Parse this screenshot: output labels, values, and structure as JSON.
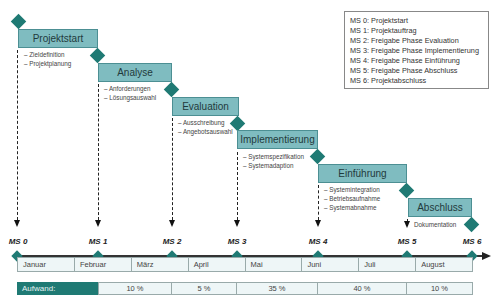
{
  "legend": {
    "items": [
      "MS 0: Projektstart",
      "MS 1: Projektauftrag",
      "MS 2: Freigabe Phase Evaluation",
      "MS 3: Freigabe Phase Implementierung",
      "MS 4: Freigabe Phase Einführung",
      "MS 5: Freigabe Phase Abschluss",
      "MS 6: Projektabschluss"
    ]
  },
  "phases": [
    {
      "name": "Projektstart",
      "tasks": [
        "– Zieldefinition",
        "– Projektplanung"
      ]
    },
    {
      "name": "Analyse",
      "tasks": [
        "– Anforderungen",
        "– Lösungsauswahl"
      ]
    },
    {
      "name": "Evaluation",
      "tasks": [
        "– Ausschreibung",
        "– Angebotsauswahl"
      ]
    },
    {
      "name": "Implementierung",
      "tasks": [
        "– Systemspezifikation",
        "– Systemadaption"
      ]
    },
    {
      "name": "Einführung",
      "tasks": [
        "– Systemintegration",
        "– Betriebsaufnahme",
        "– Systemabnahme"
      ]
    },
    {
      "name": "Abschluss",
      "tasks": [
        "Dokumentation"
      ]
    }
  ],
  "milestones": [
    "MS 0",
    "MS 1",
    "MS 2",
    "MS 3",
    "MS 4",
    "MS 5",
    "MS 6"
  ],
  "months": [
    "Januar",
    "Februar",
    "März",
    "April",
    "Mai",
    "Juni",
    "Juli",
    "August"
  ],
  "effort": {
    "label": "Aufwand:",
    "values": [
      "10 %",
      "5 %",
      "35 %",
      "40 %",
      "10 %"
    ]
  },
  "colors": {
    "accent": "#1f7a74",
    "phase_fill": "#7fbcc0",
    "cell_fill": "#eef6f7"
  }
}
